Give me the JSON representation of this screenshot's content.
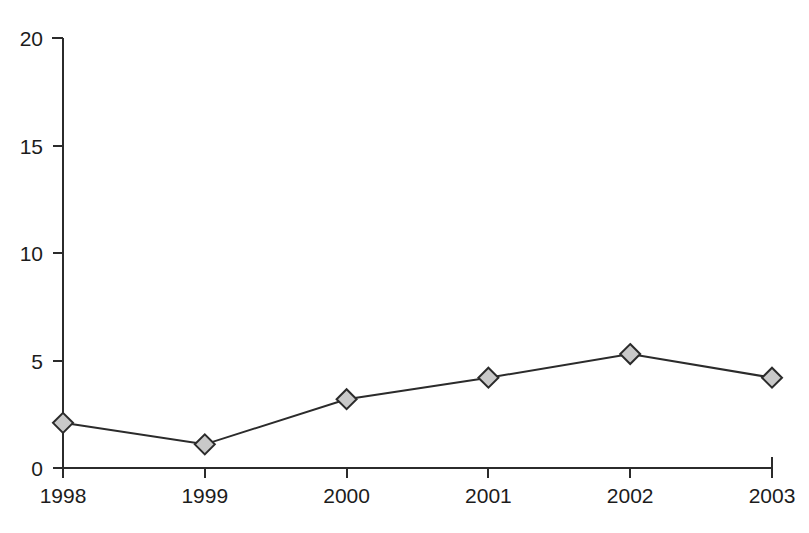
{
  "chart_data": {
    "type": "line",
    "title": "",
    "subtitle": "",
    "xlabel": "",
    "ylabel": "",
    "categories": [
      "1998",
      "1999",
      "2000",
      "2001",
      "2002",
      "2003"
    ],
    "x": [
      1998,
      1999,
      2000,
      2001,
      2002,
      2003
    ],
    "values": [
      2.1,
      1.1,
      3.2,
      4.2,
      5.3,
      4.2
    ],
    "series": [
      {
        "name": "",
        "values": [
          2.1,
          1.1,
          3.2,
          4.2,
          5.3,
          4.2
        ]
      }
    ],
    "ylim": [
      0,
      20
    ],
    "y_ticks": [
      0,
      5,
      10,
      15,
      20
    ],
    "y_tick_labels": [
      "0",
      "5",
      "10",
      "15",
      "20"
    ],
    "x_tick_labels": [
      "1998",
      "1999",
      "2000",
      "2001",
      "2002",
      "2003"
    ],
    "grid": false,
    "legend": false,
    "legend_position": "none",
    "annotations": [],
    "colors": {
      "background": "#ffffff",
      "axis": "#2b2b2b",
      "line": "#2b2b2b",
      "marker_fill": "#c9c9c9",
      "marker_stroke": "#2b2b2b",
      "text": "#1c1c1c"
    },
    "marker_shape": "diamond"
  }
}
